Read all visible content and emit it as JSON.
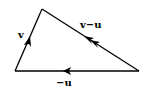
{
  "diagram": {
    "type": "vector-triangle",
    "line_color": "#000000",
    "vertices": {
      "A": [
        15,
        71
      ],
      "B": [
        42,
        9
      ],
      "C": [
        139,
        71
      ]
    },
    "vectors": [
      {
        "id": "v",
        "label": "v",
        "from": "A",
        "to": "B",
        "arrowheads": 1
      },
      {
        "id": "v_minus_u",
        "label": "v−u",
        "from": "C",
        "to": "B",
        "arrowheads": 2
      },
      {
        "id": "neg_u",
        "label": "−u",
        "from": "C",
        "to": "A",
        "arrowheads": 1
      }
    ]
  }
}
